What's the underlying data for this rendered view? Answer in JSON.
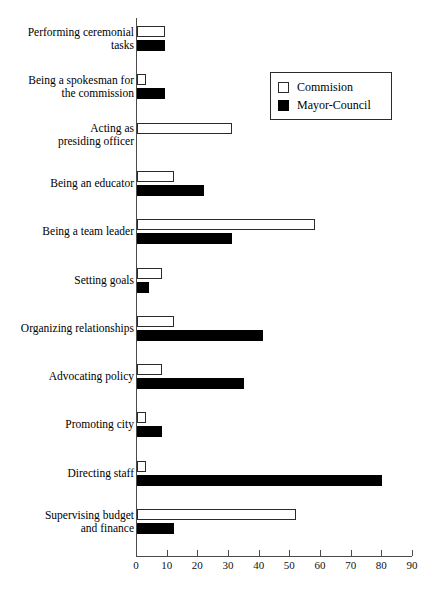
{
  "chart_data": {
    "type": "bar",
    "orientation": "horizontal",
    "title": "",
    "subtitle": "",
    "xlabel": "",
    "ylabel": "",
    "xlim": [
      0,
      90
    ],
    "xticks": [
      0,
      10,
      20,
      30,
      40,
      50,
      60,
      70,
      80,
      90
    ],
    "xtick_labels": [
      "0",
      "10",
      "20",
      "30",
      "40",
      "50",
      "60",
      "70",
      "80",
      "90"
    ],
    "grid": false,
    "legend_position": "top-right",
    "categories": [
      "Performing ceremonial\ntasks",
      "Being a spokesman for\nthe commission",
      "Acting as\npresiding officer",
      "Being an educator",
      "Being a team leader",
      "Setting goals",
      "Organizing relationships",
      "Advocating policy",
      "Promoting city",
      "Directing staff",
      "Supervising budget\nand finance"
    ],
    "series": [
      {
        "name": "Commision",
        "color": "#ffffff",
        "edge_color": "#2b2b2b",
        "values": [
          9,
          3,
          31,
          12,
          58,
          8,
          12,
          8,
          3,
          3,
          52
        ]
      },
      {
        "name": "Mayor-Council",
        "color": "#000000",
        "edge_color": "#000000",
        "values": [
          9,
          9,
          0,
          22,
          31,
          4,
          41,
          35,
          8,
          80,
          12
        ]
      }
    ]
  },
  "legend": {
    "items": [
      {
        "label": "Commision",
        "swatch": "hollow-square-icon"
      },
      {
        "label": "Mayor-Council",
        "swatch": "filled-square-icon"
      }
    ]
  },
  "axis": {
    "tick_labels": [
      "0",
      "10",
      "20",
      "30",
      "40",
      "50",
      "60",
      "70",
      "80",
      "90"
    ]
  }
}
